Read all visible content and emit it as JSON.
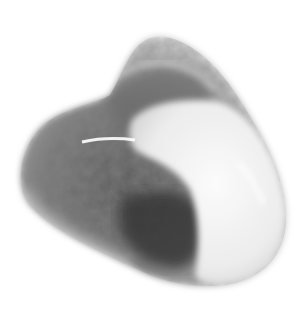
{
  "image": {
    "subject": "Polished tumbled stone",
    "description": "Grayscale photo of a rounded, triangular tumbled gemstone with a dark mottled grey-green region on the left and a smooth milky white region on the right, on a white background",
    "colors": {
      "background": "#ffffff",
      "stone_light": "#f2f2f2",
      "stone_mid": "#a8a8a8",
      "stone_dark": "#4a4a4a",
      "stone_darkest": "#2e2e2e"
    }
  }
}
